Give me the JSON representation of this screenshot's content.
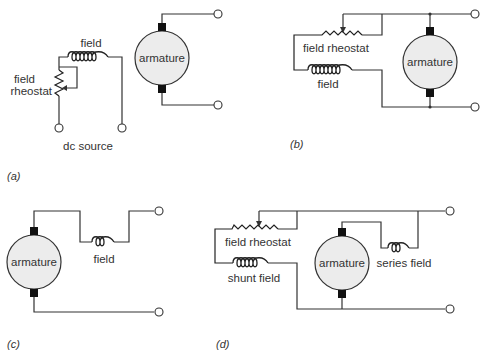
{
  "diagrams": {
    "a": {
      "caption": "(a)",
      "field_label": "field",
      "rheostat_label_line1": "field",
      "rheostat_label_line2": "rheostat",
      "armature_label": "armature",
      "source_label": "dc source"
    },
    "b": {
      "caption": "(b)",
      "rheostat_label": "field rheostat",
      "field_label": "field",
      "armature_label": "armature"
    },
    "c": {
      "caption": "(c)",
      "field_label": "field",
      "armature_label": "armature"
    },
    "d": {
      "caption": "(d)",
      "rheostat_label": "field rheostat",
      "shunt_label": "shunt field",
      "series_label": "series field",
      "armature_label": "armature"
    }
  },
  "colors": {
    "line": "#333333",
    "armature_fill": "#ececec",
    "brush": "#111111"
  }
}
